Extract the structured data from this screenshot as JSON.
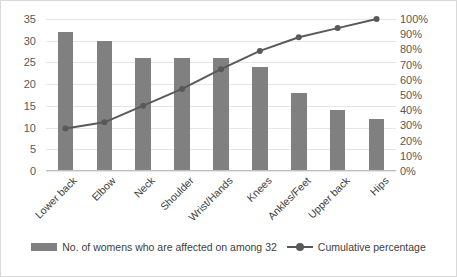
{
  "chart_data": {
    "type": "bar",
    "title": "",
    "subtitle": "",
    "xlabel": "",
    "ylabel": "",
    "categories": [
      "Lower back",
      "Elbow",
      "Neck",
      "Shoulder",
      "Wrist/Hands",
      "Knees",
      "Ankles/Feet",
      "Upper back",
      "Hips"
    ],
    "series": [
      {
        "name": "No. of womens who are affected on among 32",
        "type": "bar",
        "axis": "left",
        "values": [
          32,
          30,
          26,
          26,
          26,
          24,
          18,
          14,
          12
        ],
        "color": "#808080"
      },
      {
        "name": "Cumulative percentage",
        "type": "line",
        "axis": "right",
        "values": [
          28,
          32,
          43,
          54,
          67,
          79,
          88,
          94,
          100
        ],
        "color": "#595959"
      }
    ],
    "ylim": [
      0,
      35
    ],
    "y2lim": [
      0,
      100
    ],
    "yticks": [
      0,
      5,
      10,
      15,
      20,
      25,
      30,
      35
    ],
    "y2ticks": [
      "0%",
      "10%",
      "20%",
      "30%",
      "40%",
      "50%",
      "60%",
      "70%",
      "80%",
      "90%",
      "100%"
    ],
    "y2tick_values": [
      0,
      10,
      20,
      30,
      40,
      50,
      60,
      70,
      80,
      90,
      100
    ],
    "grid": true,
    "legend_position": "bottom",
    "legend": [
      "No. of womens who are affected on among 32",
      "Cumulative percentage"
    ]
  },
  "colors": {
    "bar": "#808080",
    "line": "#595959",
    "grid": "#e6e6e6",
    "axis": "#bfbfbf",
    "text": "#404040",
    "border": "#d9d9d9"
  }
}
